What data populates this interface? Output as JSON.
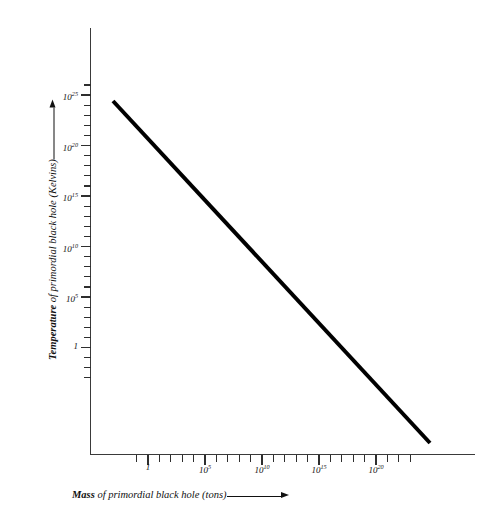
{
  "chart_data": {
    "type": "line",
    "title": "",
    "subtitle": "",
    "xlabel_plain": "Mass of primordial black hole (tons)",
    "ylabel_plain": "Temperature of primordial black hole (Kelvins)",
    "xlabel_emphasis": "Mass",
    "xlabel_rest": " of primordial black hole (tons)",
    "ylabel_emphasis": "Temperature",
    "ylabel_rest": " of primordial black hole (Kelvins)",
    "xscale": "log",
    "yscale": "log",
    "grid": false,
    "legend": null,
    "xlim_exponent": [
      -2,
      24
    ],
    "ylim_exponent": [
      -4,
      27
    ],
    "x_tick_labels": [
      {
        "base": "1",
        "exp": "",
        "exponent_value": 0
      },
      {
        "base": "10",
        "exp": "5",
        "exponent_value": 5
      },
      {
        "base": "10",
        "exp": "10",
        "exponent_value": 10
      },
      {
        "base": "10",
        "exp": "15",
        "exponent_value": 15
      },
      {
        "base": "10",
        "exp": "20",
        "exponent_value": 20
      }
    ],
    "y_tick_labels": [
      {
        "base": "10",
        "exp": "25",
        "exponent_value": 25
      },
      {
        "base": "10",
        "exp": "20",
        "exponent_value": 20
      },
      {
        "base": "10",
        "exp": "15",
        "exponent_value": 15
      },
      {
        "base": "10",
        "exp": "10",
        "exponent_value": 10
      },
      {
        "base": "10",
        "exp": "5",
        "exponent_value": 5
      },
      {
        "base": "1",
        "exp": "",
        "exponent_value": 0
      }
    ],
    "x_minor_tick_exponents": [
      -1,
      0,
      1,
      2,
      3,
      4,
      5,
      6,
      7,
      8,
      9,
      10,
      11,
      12,
      13,
      14,
      15,
      16,
      17,
      18,
      19,
      20,
      21,
      22,
      23
    ],
    "y_minor_tick_exponents": [
      -3,
      -2,
      -1,
      0,
      1,
      2,
      3,
      4,
      5,
      6,
      7,
      8,
      9,
      10,
      11,
      12,
      13,
      14,
      15,
      16,
      17,
      18,
      19,
      20,
      21,
      22,
      23,
      24,
      25,
      26
    ],
    "series": [
      {
        "name": "Hawking temperature vs mass",
        "relation": "T proportional to 1/M",
        "slope_decades_per_decade": -1,
        "color": "#000000",
        "linewidth_px": 4,
        "points_log10": [
          {
            "x": 0.0,
            "y": 24.0
          },
          {
            "x": 26.8,
            "y": -2.8
          }
        ],
        "endpoint_pixels": [
          {
            "x": 113,
            "y": 101
          },
          {
            "x": 430,
            "y": 443
          }
        ]
      }
    ],
    "axis_color": "#3a3a3a",
    "tick_color": "#2e2e2e",
    "text_color": "#111111",
    "background": "#ffffff"
  },
  "geometry": {
    "y_axis": {
      "x": 90,
      "top": 28,
      "bottom": 455
    },
    "x_axis": {
      "y": 454,
      "left": 90,
      "right": 475
    },
    "y_major_px": [
      95,
      145.5,
      196,
      246.5,
      297,
      347.5
    ],
    "y_decade_px": 10.1,
    "x_major_px": [
      148,
      205,
      262,
      319,
      376
    ],
    "x_decade_px": 11.4,
    "x_tick_start_px": 125,
    "x_tick_end_px": 433
  }
}
